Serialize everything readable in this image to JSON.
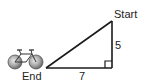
{
  "diagram": {
    "type": "right-triangle-word-problem",
    "labels": {
      "start": "Start",
      "end": "End",
      "vertical_leg": "5",
      "horizontal_leg": "7"
    },
    "right_angle_marker": true,
    "icons": {
      "vehicle": "bicycle-icon"
    },
    "colors": {
      "stroke": "#1a1a1a",
      "wheel_fill": "#9a9a9a",
      "text": "#222222"
    }
  }
}
